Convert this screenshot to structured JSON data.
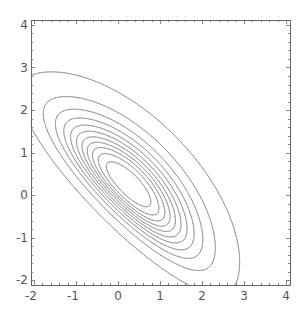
{
  "chart_data": {
    "type": "contour",
    "title": "",
    "xlabel": "",
    "ylabel": "",
    "xlim": [
      -2.07,
      4.1
    ],
    "ylim": [
      -2.12,
      4.12
    ],
    "xticks": [
      -2,
      -1,
      0,
      1,
      2,
      3,
      4
    ],
    "yticks": [
      -2,
      -1,
      0,
      1,
      2,
      3,
      4
    ],
    "xtick_labels": [
      "-2",
      "-1",
      "0",
      "1",
      "2",
      "3",
      "4"
    ],
    "ytick_labels": [
      "-2",
      "-1",
      "0",
      "1",
      "2",
      "3",
      "4"
    ],
    "grid": false,
    "legend": null,
    "line_color": "#9a9a9a",
    "frame_color": "#666666",
    "num_contours": 11,
    "function_model": {
      "description": "skew-normal bivariate density approximation",
      "rho": -0.55,
      "alpha": [
        2.2,
        2.2
      ]
    },
    "contour_levels_fraction_of_max": [
      0.02,
      0.09,
      0.17,
      0.25,
      0.33,
      0.41,
      0.49,
      0.57,
      0.65,
      0.74,
      0.85
    ],
    "contour_extents": [
      {
        "level": 1,
        "top": [
          -0.6,
          3.8
        ],
        "right": [
          3.8,
          -0.3
        ],
        "left": [
          -1.6,
          1.75
        ],
        "bottom": [
          1.5,
          -1.7
        ]
      },
      {
        "level": 2,
        "top": [
          -0.6,
          2.9
        ],
        "right": [
          2.9,
          -0.3
        ]
      },
      {
        "level": 3,
        "top": [
          -0.5,
          2.4
        ]
      },
      {
        "level": 4,
        "top": [
          -0.5,
          2.05
        ]
      },
      {
        "level": 5,
        "top": [
          -0.4,
          1.75
        ]
      },
      {
        "level": 6,
        "top": [
          -0.4,
          1.5
        ]
      },
      {
        "level": 7,
        "top": [
          -0.3,
          1.3
        ]
      },
      {
        "level": 8,
        "top": [
          -0.2,
          1.1
        ]
      },
      {
        "level": 9,
        "top": [
          -0.1,
          0.9
        ]
      },
      {
        "level": 10,
        "top": [
          0.0,
          0.7
        ]
      },
      {
        "level": 11,
        "center": [
          0.1,
          0.1
        ],
        "top": [
          0.0,
          0.45
        ]
      }
    ]
  },
  "layout": {
    "frame": {
      "left": 31,
      "top": 20,
      "right": 290,
      "bottom": 285
    },
    "x_origin_px": 118,
    "x_unit_px": 42,
    "y_origin_px": 195,
    "y_unit_px": 42.5
  }
}
